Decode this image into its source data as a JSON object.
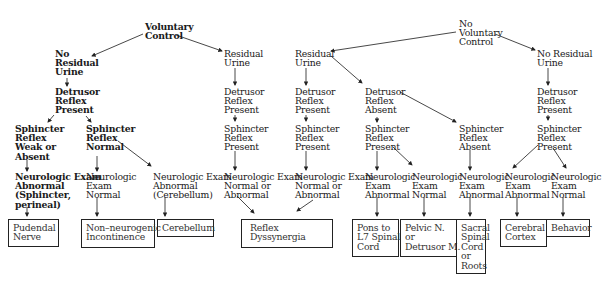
{
  "roots": {
    "voluntary": "Voluntary\nControl",
    "no_voluntary": "No\nVoluntary\nControl"
  },
  "nodes": {
    "c1_no_residual": "No\nResidual\nUrine",
    "c1_detrusor": "Detrusor\nReflex\nPresent",
    "c1a_sphincter": "Sphincter\nReflex\nWeak or\nAbsent",
    "c1a_neuro": "Neurologic Exam\nAbnormal\n(Sphincter,\nperineal)",
    "c1b_sphincter": "Sphincter\nReflex\nNormal",
    "c1b_neuro": "Neurologic\nExam\nNormal",
    "c1c_neuro": "Neurologic Exam\nAbnormal\n(Cerebellum)",
    "c2_residual": "Residual\nUrine",
    "c2_detrusor": "Detrusor\nReflex\nPresent",
    "c2_sphincter": "Sphincter\nReflex\nPresent",
    "c2_neuro": "Neurologic Exam\nNormal or\nAbnormal",
    "c3_residual": "Residual\nUrine",
    "c3_detrusor": "Detrusor\nReflex\nPresent",
    "c3_sphincter": "Sphincter\nReflex\nPresent",
    "c3_neuro": "Neurologic Exam\nNormal or\nAbnormal",
    "c4_detrusor": "Detrusor\nReflex\nAbsent",
    "c4_sphincter": "Sphincter\nReflex\nPresent",
    "c4a_neuro": "Neurologic\nExam\nAbnormal",
    "c4b_neuro": "Neurologic\nExam\nNormal",
    "c5_sphincter": "Sphincter\nReflex\nAbsent",
    "c5_neuro": "Neurologic\nExam\nAbnormal",
    "c6_no_residual": "No Residual\nUrine",
    "c6_detrusor": "Detrusor\nReflex\nPresent",
    "c6_sphincter": "Sphincter\nReflex\nPresent",
    "c6a_neuro": "Neurologic\nExam\nAbnormal",
    "c6b_neuro": "Neurologic\nExam\nNormal"
  },
  "outcomes": {
    "pudendal": "Pudendal\nNerve",
    "non_neurogenic": "Non–neurogenic\nIncontinence",
    "cerebellum": "Cerebellum",
    "reflex_dyssynergia": "Reflex\nDyssynergia",
    "pons": "Pons to\nL7 Spinal\nCord",
    "pelvic": "Pelvic N.\nor\nDetrusor M.",
    "sacral": "Sacral\nSpinal\nCord\nor\nRoots",
    "cerebral": "Cerebral\nCortex",
    "behavior": "Behavior"
  }
}
